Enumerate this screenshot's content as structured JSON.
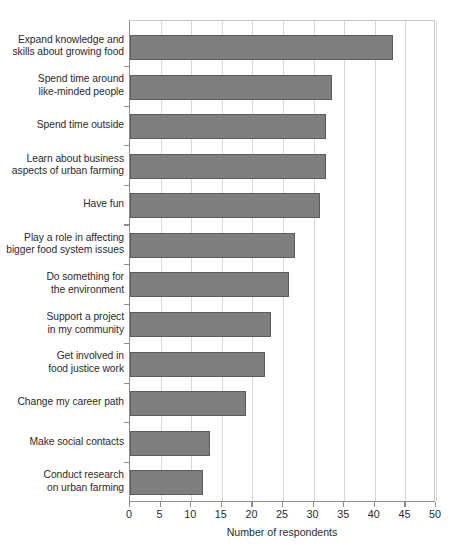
{
  "chart_data": {
    "type": "bar",
    "orientation": "horizontal",
    "title": "",
    "xlabel": "Number of respondents",
    "ylabel": "",
    "xlim": [
      0,
      50
    ],
    "xticks": [
      0,
      5,
      10,
      15,
      20,
      25,
      30,
      35,
      40,
      45,
      50
    ],
    "grid": true,
    "legend": false,
    "bar_color": "#7f7f7f",
    "bar_edge_color": "#5c5c5c",
    "categories": [
      "Expand knowledge and\nskills about growing food",
      "Spend time around\nlike-minded people",
      "Spend time outside",
      "Learn about business\naspects of urban farming",
      "Have fun",
      "Play a role in affecting\nbigger food system issues",
      "Do something for\nthe environment",
      "Support a project\nin my community",
      "Get involved in\nfood justice work",
      "Change my career path",
      "Make social contacts",
      "Conduct research\non urban farming"
    ],
    "values": [
      43,
      33,
      32,
      32,
      31,
      27,
      26,
      23,
      22,
      19,
      13,
      12
    ]
  },
  "caption": {
    "fragment": ""
  }
}
